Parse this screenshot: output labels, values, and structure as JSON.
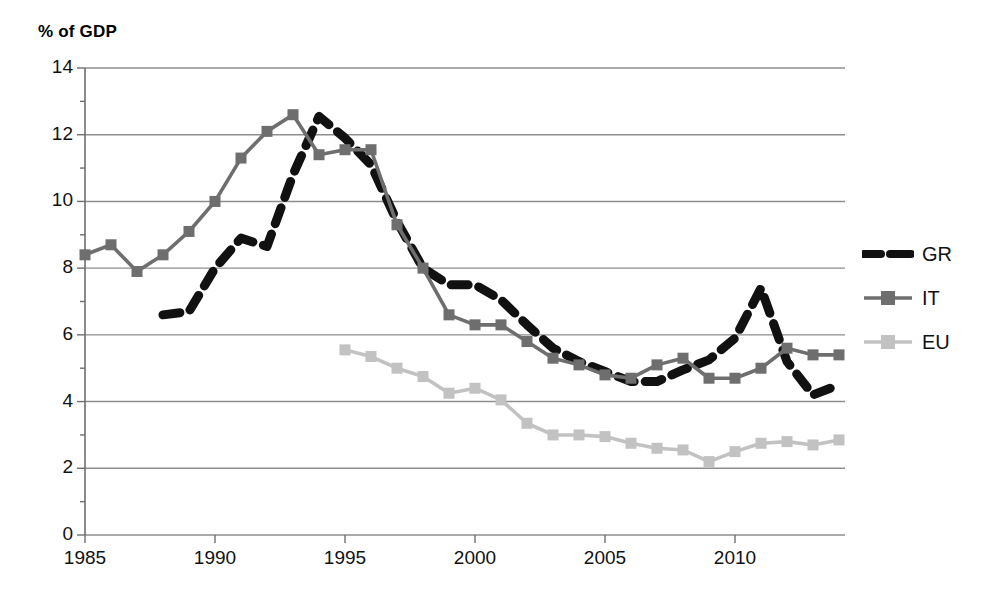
{
  "chart_data": {
    "type": "line",
    "title": "% of GDP",
    "xlabel": "",
    "ylabel": "% of GDP",
    "xlim": [
      1985,
      2014
    ],
    "ylim": [
      0,
      14
    ],
    "ytick_step": 2,
    "yticks": [
      "0",
      "2",
      "4",
      "6",
      "8",
      "10",
      "12",
      "14"
    ],
    "xticks": [
      "1985",
      "1990",
      "1995",
      "2000",
      "2005",
      "2010"
    ],
    "grid": "horizontal",
    "legend_position": "right",
    "x": [
      1985,
      1986,
      1987,
      1988,
      1989,
      1990,
      1991,
      1992,
      1993,
      1994,
      1995,
      1996,
      1997,
      1998,
      1999,
      2000,
      2001,
      2002,
      2003,
      2004,
      2005,
      2006,
      2007,
      2008,
      2009,
      2010,
      2011,
      2012,
      2013,
      2014
    ],
    "series": [
      {
        "name": "GR",
        "color": "#111111",
        "style": "dashed",
        "marker": "none",
        "x": [
          1988,
          1989,
          1990,
          1991,
          1992,
          1993,
          1994,
          1995,
          1996,
          1997,
          1998,
          1999,
          2000,
          2001,
          2002,
          2003,
          2004,
          2005,
          2006,
          2007,
          2008,
          2009,
          2010,
          2011,
          2012,
          2013,
          2014
        ],
        "values": [
          6.6,
          6.7,
          8.0,
          8.9,
          8.65,
          10.8,
          12.55,
          11.9,
          11.1,
          9.4,
          8.0,
          7.5,
          7.5,
          7.05,
          6.3,
          5.6,
          5.2,
          4.9,
          4.6,
          4.6,
          4.95,
          5.25,
          5.9,
          7.4,
          5.2,
          4.2,
          4.5
        ]
      },
      {
        "name": "IT",
        "color": "#6e6e6e",
        "style": "solid",
        "marker": "square",
        "x": [
          1985,
          1986,
          1987,
          1988,
          1989,
          1990,
          1991,
          1992,
          1993,
          1994,
          1995,
          1996,
          1997,
          1998,
          1999,
          2000,
          2001,
          2002,
          2003,
          2004,
          2005,
          2006,
          2007,
          2008,
          2009,
          2010,
          2011,
          2012,
          2013,
          2014
        ],
        "values": [
          8.4,
          8.7,
          7.9,
          8.4,
          9.1,
          10.0,
          11.3,
          12.1,
          12.6,
          11.4,
          11.55,
          11.55,
          9.3,
          8.0,
          6.6,
          6.3,
          6.3,
          5.8,
          5.3,
          5.1,
          4.8,
          4.7,
          5.1,
          5.3,
          4.7,
          4.7,
          5.0,
          5.6,
          5.4,
          5.4
        ]
      },
      {
        "name": "EU",
        "color": "#c2c2c2",
        "style": "solid",
        "marker": "square",
        "x": [
          1995,
          1996,
          1997,
          1998,
          1999,
          2000,
          2001,
          2002,
          2003,
          2004,
          2005,
          2006,
          2007,
          2008,
          2009,
          2010,
          2011,
          2012,
          2013,
          2014
        ],
        "values": [
          5.55,
          5.35,
          5.0,
          4.75,
          4.25,
          4.4,
          4.05,
          3.35,
          3.0,
          3.0,
          2.95,
          2.75,
          2.6,
          2.55,
          2.2,
          2.5,
          2.75,
          2.8,
          2.7,
          2.85
        ]
      }
    ]
  },
  "legend": {
    "items": [
      {
        "label": "GR"
      },
      {
        "label": "IT"
      },
      {
        "label": "EU"
      }
    ]
  },
  "colors": {
    "gr": "#111111",
    "it": "#6e6e6e",
    "eu": "#c2c2c2",
    "grid": "#8e8e8e",
    "axis": "#6f6f6f"
  }
}
